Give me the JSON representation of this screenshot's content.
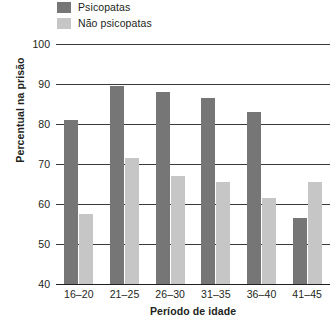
{
  "chart_data": {
    "type": "bar",
    "title": "",
    "xlabel": "Período de idade",
    "ylabel": "Percentual na prisão",
    "categories": [
      "16–20",
      "21–25",
      "26–30",
      "31–35",
      "36–40",
      "41–45"
    ],
    "series": [
      {
        "name": "Psicopatas",
        "color": "#767676",
        "values": [
          81,
          89.5,
          88,
          86.5,
          83,
          56.5
        ]
      },
      {
        "name": "Não psicopatas",
        "color": "#c6c6c6",
        "values": [
          57.5,
          71.5,
          67,
          65.5,
          61.5,
          65.5
        ]
      }
    ],
    "ylim": [
      40,
      100
    ],
    "ytick_values": [
      100,
      90,
      80,
      70,
      60,
      50,
      40
    ],
    "ytick_labels": [
      "100",
      "90",
      "80",
      "70",
      "60",
      "50",
      "40"
    ],
    "grid": true,
    "legend_position": "top-left",
    "axis_color": "#231f20",
    "grid_color": "#3a3a3a",
    "background": "#ffffff"
  }
}
